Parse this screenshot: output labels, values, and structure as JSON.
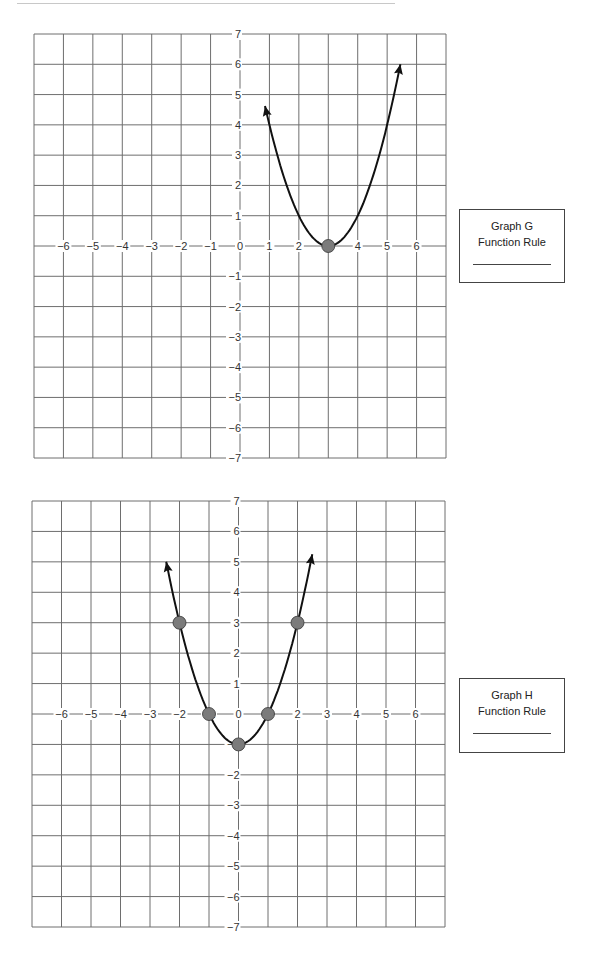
{
  "chart_data": [
    {
      "type": "line",
      "title": "Graph G",
      "xlabel": "",
      "ylabel": "",
      "xlim": [
        -7,
        7
      ],
      "ylim": [
        -7,
        7
      ],
      "x_ticks": [
        -6,
        -5,
        -4,
        -3,
        -2,
        -1,
        0,
        1,
        2,
        3,
        4,
        5,
        6
      ],
      "y_ticks": [
        -7,
        -6,
        -5,
        -4,
        -3,
        -2,
        -1,
        1,
        2,
        3,
        4,
        5,
        6,
        7
      ],
      "grid": true,
      "curve": {
        "kind": "parabola",
        "vertex": [
          3,
          0
        ],
        "a": 1,
        "x_range": [
          0.85,
          5.45
        ],
        "arrows": "both ends"
      },
      "points": [
        {
          "x": 3,
          "y": 0
        }
      ]
    },
    {
      "type": "line",
      "title": "Graph H",
      "xlabel": "",
      "ylabel": "",
      "xlim": [
        -7,
        7
      ],
      "ylim": [
        -7,
        7
      ],
      "x_ticks": [
        -6,
        -5,
        -4,
        -3,
        -2,
        -1,
        0,
        1,
        2,
        3,
        4,
        5,
        6
      ],
      "y_ticks": [
        -7,
        -6,
        -5,
        -4,
        -3,
        -2,
        -1,
        1,
        2,
        3,
        4,
        5,
        6,
        7
      ],
      "grid": true,
      "curve": {
        "kind": "parabola",
        "vertex": [
          0,
          -1
        ],
        "a": 1,
        "x_range": [
          -2.45,
          2.5
        ],
        "arrows": "both ends"
      },
      "points": [
        {
          "x": -2,
          "y": 3
        },
        {
          "x": -1,
          "y": 0
        },
        {
          "x": 0,
          "y": -1
        },
        {
          "x": 1,
          "y": 0
        },
        {
          "x": 2,
          "y": 3
        }
      ]
    }
  ],
  "graphs": [
    {
      "box_title": "Graph G",
      "box_label": "Function Rule",
      "answer": ""
    },
    {
      "box_title": "Graph H",
      "box_label": "Function Rule",
      "answer": ""
    }
  ],
  "colors": {
    "grid": "#6e6e6e",
    "curve": "#111111",
    "point_fill": "#7b7b7b",
    "point_stroke": "#333333",
    "text": "#333333"
  }
}
